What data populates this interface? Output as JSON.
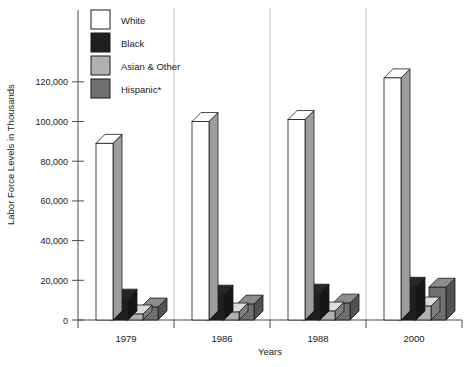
{
  "chart_data": {
    "type": "bar",
    "title": "",
    "xlabel": "Years",
    "ylabel": "Labor Force Levels in Thousands",
    "categories": [
      "1979",
      "1986",
      "1988",
      "2000"
    ],
    "ylim": [
      0,
      130000
    ],
    "ytick_values": [
      0,
      20000,
      40000,
      60000,
      80000,
      100000,
      120000
    ],
    "ytick_labels": [
      "0",
      "20,000",
      "40,000",
      "60,000",
      "80,000",
      "100,000",
      "120,000"
    ],
    "grid": false,
    "legend_position": "top-center",
    "style": "3d-grouped-bars",
    "series": [
      {
        "name": "White",
        "color": "#ffffff",
        "values": [
          89000,
          100000,
          101000,
          122000
        ]
      },
      {
        "name": "Black",
        "color": "#1f1f1f",
        "values": [
          11000,
          13000,
          13500,
          17000
        ]
      },
      {
        "name": "Asian & Other",
        "color": "#b0b0b0",
        "values": [
          3000,
          4000,
          4500,
          7000
        ]
      },
      {
        "name": "Hispanic*",
        "color": "#707070",
        "values": [
          6500,
          8000,
          8500,
          16500
        ]
      }
    ]
  },
  "legend": {
    "items": [
      {
        "label": "White",
        "color": "#ffffff"
      },
      {
        "label": "Black",
        "color": "#1f1f1f"
      },
      {
        "label": "Asian & Other",
        "color": "#b0b0b0"
      },
      {
        "label": "Hispanic*",
        "color": "#707070"
      }
    ]
  },
  "axes": {
    "y_title": "Labor Force Levels in Thousands",
    "x_title": "Years",
    "y_ticks": [
      "120,000",
      "100,000",
      "80,000",
      "60,000",
      "40,000",
      "20,000",
      "0"
    ],
    "x_ticks": [
      "1979",
      "1986",
      "1988",
      "2000"
    ]
  }
}
